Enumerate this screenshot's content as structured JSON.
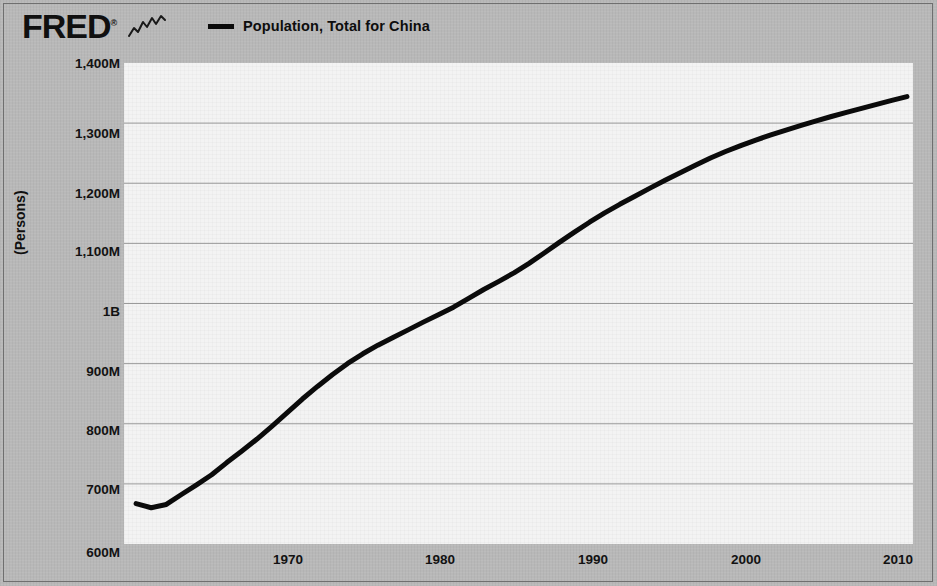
{
  "header": {
    "brand": "FRED",
    "brand_registered": "®",
    "squiggle_icon": "chart-squiggle-icon",
    "legend": {
      "swatch_color": "#0b0b0b",
      "label": "Population, Total for China"
    }
  },
  "axes": {
    "ylabel": "(Persons)",
    "ytick_labels": [
      "1,400M",
      "1,300M",
      "1,200M",
      "1,100M",
      "1B",
      "900M",
      "800M",
      "700M",
      "600M"
    ],
    "xtick_labels": [
      "1970",
      "1980",
      "1990",
      "2000",
      "2010"
    ]
  },
  "colors": {
    "page_background": "#b8b8b8",
    "plot_background": "#f3f3f3",
    "gridline": "#9a9a9a",
    "line": "#0b0b0b",
    "text": "#121212"
  },
  "chart_data": {
    "type": "line",
    "title": "",
    "subtitle": "",
    "xlabel": "",
    "ylabel": "(Persons)",
    "xlim": [
      1959.2,
      2011.4
    ],
    "ylim": [
      600000000,
      1400000000
    ],
    "grid": true,
    "legend_position": "top",
    "ytick_values": [
      1400000000,
      1300000000,
      1200000000,
      1100000000,
      1000000000,
      900000000,
      800000000,
      700000000,
      600000000
    ],
    "ytick_labels": [
      "1,400M",
      "1,300M",
      "1,200M",
      "1,100M",
      "1B",
      "900M",
      "800M",
      "700M",
      "600M"
    ],
    "xtick_values": [
      1970,
      1980,
      1990,
      2000,
      2010
    ],
    "xtick_labels": [
      "1970",
      "1980",
      "1990",
      "2000",
      "2010"
    ],
    "series": [
      {
        "name": "Population, Total for China",
        "color": "#0b0b0b",
        "units": "Persons",
        "x": [
          1960,
          1961,
          1962,
          1963,
          1964,
          1965,
          1966,
          1967,
          1968,
          1969,
          1970,
          1971,
          1972,
          1973,
          1974,
          1975,
          1976,
          1977,
          1978,
          1979,
          1980,
          1981,
          1982,
          1983,
          1984,
          1985,
          1986,
          1987,
          1988,
          1989,
          1990,
          1991,
          1992,
          1993,
          1994,
          1995,
          1996,
          1997,
          1998,
          1999,
          2000,
          2001,
          2002,
          2003,
          2004,
          2005,
          2006,
          2007,
          2008,
          2009,
          2010,
          2011
        ],
        "values": [
          667070000,
          660330000,
          665770000,
          682335000,
          698355000,
          715185000,
          735400000,
          754550000,
          774510000,
          796025000,
          818315000,
          841105000,
          862030000,
          881940000,
          900350000,
          916395000,
          930685000,
          943455000,
          956165000,
          969005000,
          981235000,
          993885000,
          1008630000,
          1023310000,
          1036825000,
          1051040000,
          1066790000,
          1084035000,
          1101630000,
          1118650000,
          1135185000,
          1150780000,
          1164970000,
          1178440000,
          1191835000,
          1204855000,
          1217550000,
          1230075000,
          1241935000,
          1252735000,
          1262645000,
          1271850000,
          1280400000,
          1288400000,
          1296075000,
          1303720000,
          1311020000,
          1317885000,
          1324655000,
          1331260000,
          1337705000,
          1344130000
        ]
      }
    ]
  }
}
